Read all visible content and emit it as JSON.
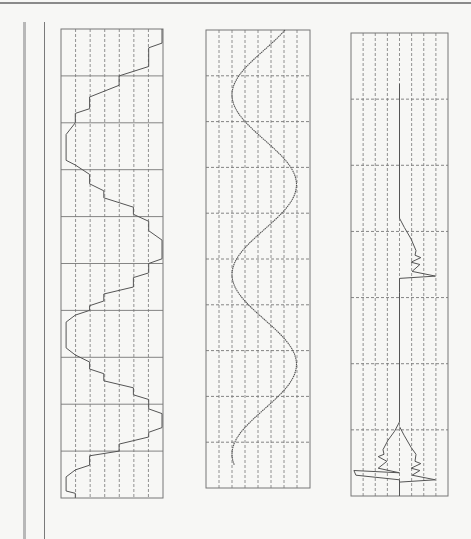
{
  "page": {
    "background": "#f7f7f5",
    "line_color": "#555555",
    "grid_color": "#777777"
  },
  "chart_data": [
    {
      "type": "line",
      "title": "",
      "description": "Staircase (quantized) sinusoid, vertical time axis",
      "xlabel": "",
      "ylabel": "",
      "grid": true,
      "box": {
        "x": 61,
        "y": 29,
        "w": 102,
        "h": 469
      },
      "v_grid": {
        "count": 6,
        "style": "dashed"
      },
      "h_grid": {
        "count": 9,
        "style": "solid"
      },
      "points": [
        [
          0.99,
          0
        ],
        [
          0.99,
          0.03
        ],
        [
          0.86,
          0.04
        ],
        [
          0.86,
          0.08
        ],
        [
          0.57,
          0.1
        ],
        [
          0.57,
          0.12
        ],
        [
          0.28,
          0.145
        ],
        [
          0.28,
          0.17
        ],
        [
          0.14,
          0.18
        ],
        [
          0.14,
          0.2
        ],
        [
          0.05,
          0.225
        ],
        [
          0.05,
          0.28
        ],
        [
          0.14,
          0.29
        ],
        [
          0.28,
          0.31
        ],
        [
          0.28,
          0.33
        ],
        [
          0.42,
          0.345
        ],
        [
          0.42,
          0.36
        ],
        [
          0.71,
          0.38
        ],
        [
          0.71,
          0.395
        ],
        [
          0.86,
          0.41
        ],
        [
          0.86,
          0.43
        ],
        [
          0.99,
          0.45
        ],
        [
          0.99,
          0.49
        ],
        [
          0.86,
          0.5
        ],
        [
          0.86,
          0.52
        ],
        [
          0.71,
          0.53
        ],
        [
          0.71,
          0.55
        ],
        [
          0.42,
          0.565
        ],
        [
          0.42,
          0.58
        ],
        [
          0.28,
          0.59
        ],
        [
          0.28,
          0.6
        ],
        [
          0.14,
          0.61
        ],
        [
          0.05,
          0.625
        ],
        [
          0.05,
          0.68
        ],
        [
          0.14,
          0.695
        ],
        [
          0.28,
          0.71
        ],
        [
          0.28,
          0.725
        ],
        [
          0.42,
          0.735
        ],
        [
          0.42,
          0.75
        ],
        [
          0.71,
          0.765
        ],
        [
          0.71,
          0.78
        ],
        [
          0.86,
          0.79
        ],
        [
          0.86,
          0.81
        ],
        [
          0.99,
          0.82
        ],
        [
          0.99,
          0.85
        ],
        [
          0.86,
          0.86
        ],
        [
          0.86,
          0.87
        ],
        [
          0.57,
          0.885
        ],
        [
          0.57,
          0.9
        ],
        [
          0.28,
          0.91
        ],
        [
          0.28,
          0.93
        ],
        [
          0.14,
          0.94
        ],
        [
          0.05,
          0.955
        ],
        [
          0.05,
          0.985
        ],
        [
          0.14,
          0.99
        ],
        [
          0.14,
          1
        ]
      ]
    },
    {
      "type": "line",
      "title": "",
      "description": "Smooth sinusoid, about 2.5 cycles, vertical time axis",
      "xlabel": "",
      "ylabel": "",
      "grid": true,
      "box": {
        "x": 206,
        "y": 30,
        "w": 104,
        "h": 458
      },
      "v_grid": {
        "count": 7,
        "style": "dashed"
      },
      "h_grid": {
        "count": 9,
        "style": "dashed"
      },
      "sine": {
        "x_center": 0.56,
        "amplitude": 0.31,
        "phase_start_deg": 140,
        "cycles": 2.55,
        "end_y": 0.95
      }
    },
    {
      "type": "line",
      "title": "",
      "description": "Baseline at center with periodic ramp-and-spike transients",
      "xlabel": "",
      "ylabel": "",
      "grid": true,
      "box": {
        "x": 351,
        "y": 33,
        "w": 97,
        "h": 463
      },
      "v_grid": {
        "count": 7,
        "style": "dashed"
      },
      "h_grid": {
        "count": 6,
        "style": "dashed"
      },
      "points": [
        [
          0.5,
          0.11
        ],
        [
          0.5,
          0.4
        ],
        [
          0.55,
          0.42
        ],
        [
          0.62,
          0.445
        ],
        [
          0.67,
          0.47
        ],
        [
          0.66,
          0.48
        ],
        [
          0.72,
          0.485
        ],
        [
          0.62,
          0.495
        ],
        [
          0.71,
          0.5
        ],
        [
          0.63,
          0.515
        ],
        [
          0.87,
          0.525
        ],
        [
          0.5,
          0.53
        ],
        [
          0.5,
          0.56
        ],
        [
          0.5,
          0.84
        ],
        [
          0.45,
          0.86
        ],
        [
          0.38,
          0.88
        ],
        [
          0.33,
          0.9
        ],
        [
          0.34,
          0.91
        ],
        [
          0.28,
          0.915
        ],
        [
          0.37,
          0.925
        ],
        [
          0.28,
          0.94
        ],
        [
          0.5,
          0.95
        ],
        [
          0.03,
          0.945
        ],
        [
          0.05,
          0.955
        ],
        [
          0.5,
          0.965
        ],
        [
          0.5,
          1
        ]
      ],
      "segments": [
        [
          [
            0.5,
            0.62
          ],
          [
            0.5,
            0.84
          ]
        ],
        [
          [
            0.5,
            0.85
          ],
          [
            0.55,
            0.87
          ],
          [
            0.62,
            0.895
          ],
          [
            0.67,
            0.91
          ],
          [
            0.66,
            0.925
          ],
          [
            0.72,
            0.93
          ],
          [
            0.62,
            0.94
          ],
          [
            0.71,
            0.945
          ],
          [
            0.63,
            0.955
          ],
          [
            0.87,
            0.965
          ],
          [
            0.5,
            0.97
          ]
        ]
      ],
      "transients_y": [
        0.48,
        0.94,
        0.48
      ]
    }
  ]
}
